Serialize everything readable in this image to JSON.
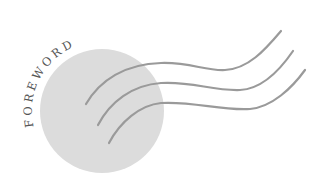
{
  "illustration": {
    "title": "FOREWORD",
    "colors": {
      "background": "#ffffff",
      "disc": "#dcdcdc",
      "lines": "#9a9a9a",
      "text": "#555555"
    },
    "disc": {
      "cx": 102,
      "cy": 111,
      "r": 62
    },
    "wave_lines": [
      {
        "name": "wave-line-1",
        "d": "M86,104 C100,80 125,64 161,63 C190,62 205,71 225,70 C248,69 265,50 281,31"
      },
      {
        "name": "wave-line-2",
        "d": "M98,125 C110,102 132,85 161,83 C192,81 212,91 240,90 C262,89 280,70 293,51"
      },
      {
        "name": "wave-line-3",
        "d": "M109,143 C120,122 140,105 161,103 C193,101 222,111 250,109 C272,107 292,88 305,70"
      }
    ]
  }
}
